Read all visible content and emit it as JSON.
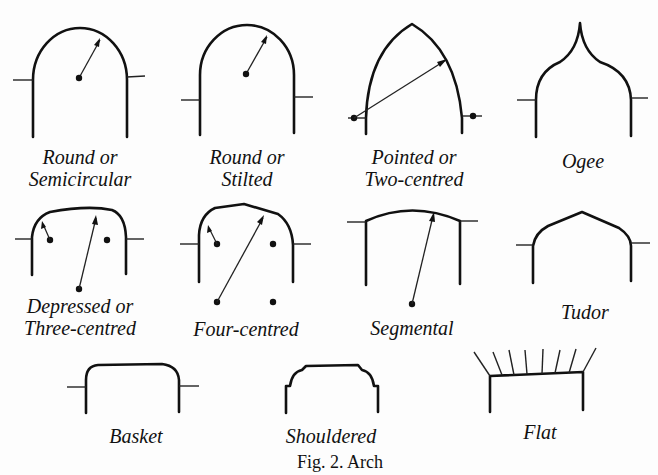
{
  "figure": {
    "caption": "Fig. 2. Arch",
    "arches": [
      {
        "id": "round-semicircular",
        "line1": "Round or",
        "line2": "Semicircular"
      },
      {
        "id": "round-stilted",
        "line1": "Round or",
        "line2": "Stilted"
      },
      {
        "id": "pointed-two-centred",
        "line1": "Pointed or",
        "line2": "Two-centred"
      },
      {
        "id": "ogee",
        "line1": "Ogee",
        "line2": ""
      },
      {
        "id": "depressed-three-centred",
        "line1": "Depressed or",
        "line2": "Three-centred"
      },
      {
        "id": "four-centred",
        "line1": "Four-centred",
        "line2": ""
      },
      {
        "id": "segmental",
        "line1": "Segmental",
        "line2": ""
      },
      {
        "id": "tudor",
        "line1": "Tudor",
        "line2": ""
      },
      {
        "id": "basket",
        "line1": "Basket",
        "line2": ""
      },
      {
        "id": "shouldered",
        "line1": "Shouldered",
        "line2": ""
      },
      {
        "id": "flat",
        "line1": "Flat",
        "line2": ""
      }
    ]
  }
}
